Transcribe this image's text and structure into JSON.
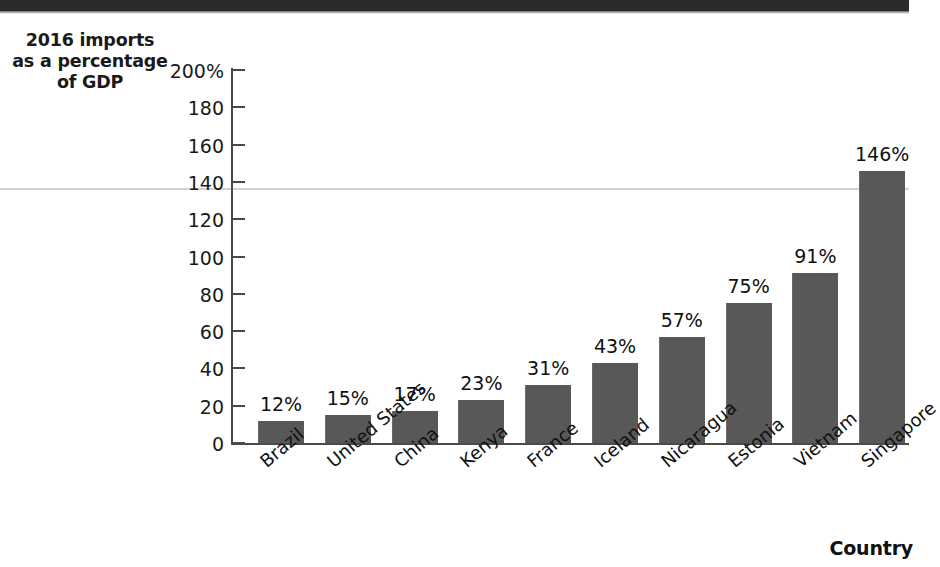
{
  "page": {
    "background": "#ffffff",
    "top_band_color": "#2b2b2b"
  },
  "chart_data": {
    "type": "bar",
    "title": "",
    "ylabel": "2016 imports as a percentage of GDP",
    "ylabel_lines": [
      "2016 imports",
      "as a percentage",
      "of GDP"
    ],
    "xlabel": "Country",
    "categories": [
      "Brazil",
      "United States",
      "China",
      "Kenya",
      "France",
      "Iceland",
      "Nicaragua",
      "Estonia",
      "Vietnam",
      "Singapore"
    ],
    "values": [
      12,
      15,
      17,
      23,
      31,
      43,
      57,
      75,
      91,
      146
    ],
    "value_labels": [
      "12%",
      "15%",
      "17%",
      "23%",
      "31%",
      "43%",
      "57%",
      "75%",
      "91%",
      "146%"
    ],
    "ylim": [
      0,
      200
    ],
    "ytick_values": [
      0,
      20,
      40,
      60,
      80,
      100,
      120,
      140,
      160,
      180,
      200
    ],
    "ytick_labels": [
      "0",
      "20",
      "40",
      "60",
      "80",
      "100",
      "120",
      "140",
      "160",
      "180",
      "200%"
    ],
    "grid": false,
    "legend": null,
    "bar_color": "#585858",
    "axis_color": "#4a4a4a"
  }
}
